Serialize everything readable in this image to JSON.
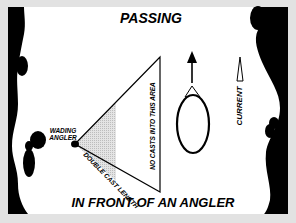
{
  "diagram": {
    "title_top": "PASSING",
    "title_bottom": "IN FRONT OF AN ANGLER",
    "angler_label_line1": "WADING",
    "angler_label_line2": "ANGLER",
    "cast_length_label": "DOUBLE CAST LENGTH",
    "no_cast_label": "NO CASTS INTO THIS AREA",
    "current_label": "CURRENT",
    "colors": {
      "frame": "#e2e2e2",
      "shore": "#000000",
      "water": "#ffffff",
      "shaded_area": "#d4d4d4"
    }
  }
}
